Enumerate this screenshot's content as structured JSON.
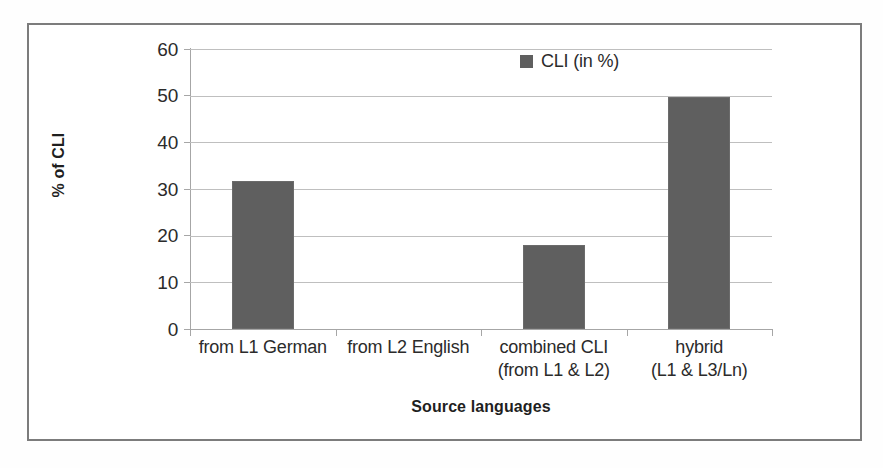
{
  "figure": {
    "frame_color": "#7c7c7c",
    "background": "#ffffff"
  },
  "chart_data": {
    "type": "bar",
    "title": "",
    "categories": [
      "from L1 German",
      "from L2 English",
      "combined CLI",
      "hybrid"
    ],
    "category_lines": [
      [
        "from L1 German",
        ""
      ],
      [
        "from L2 English",
        ""
      ],
      [
        "combined CLI",
        "(from L1 & L2)"
      ],
      [
        "hybrid",
        "(L1 & L3/Ln)"
      ]
    ],
    "values": [
      31.7,
      0,
      17.9,
      49.7
    ],
    "series": [
      {
        "name": "CLI (in %)",
        "values": [
          31.7,
          0,
          17.9,
          49.7
        ],
        "color": "#5f5f5f"
      }
    ],
    "xlabel": "Source languages",
    "ylabel": "% of CLI",
    "ylim": [
      0,
      60
    ],
    "ytick_values": [
      0,
      10,
      20,
      30,
      40,
      50,
      60
    ],
    "ytick_labels": [
      "0",
      "10",
      "20",
      "30",
      "40",
      "50",
      "60"
    ],
    "grid": "horizontal",
    "legend_position": "top-center-right",
    "legend": [
      "CLI (in %)"
    ],
    "bar_color": "#5f5f5f",
    "gridline_color": "#bfbfbf",
    "axis_color": "#a6a6a6"
  },
  "axis": {
    "y_title": "% of CLI",
    "x_title": "Source languages"
  },
  "legend": {
    "entry_label": "CLI (in %)",
    "swatch_color": "#5f5f5f"
  }
}
